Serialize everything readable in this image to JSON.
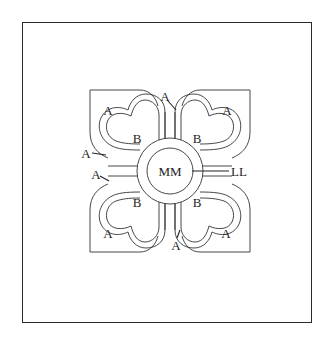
{
  "diagram": {
    "type": "labeled anatomical/structural schematic",
    "center": {
      "outer_label": "MM",
      "pointer_label": "LL"
    },
    "quadrants": [
      {
        "position": "top-left",
        "petal_label": "B",
        "leaf_label": "A"
      },
      {
        "position": "top-right",
        "petal_label": "B",
        "leaf_label": "A"
      },
      {
        "position": "bottom-left",
        "petal_label": "B",
        "leaf_label": "A"
      },
      {
        "position": "bottom-right",
        "petal_label": "B",
        "leaf_label": "A"
      }
    ],
    "callouts": [
      {
        "id": "top",
        "label": "A"
      },
      {
        "id": "left-upper",
        "label": "A"
      },
      {
        "id": "left-lower",
        "label": "A"
      },
      {
        "id": "bottom",
        "label": "A"
      },
      {
        "id": "right",
        "label": "LL"
      }
    ]
  }
}
